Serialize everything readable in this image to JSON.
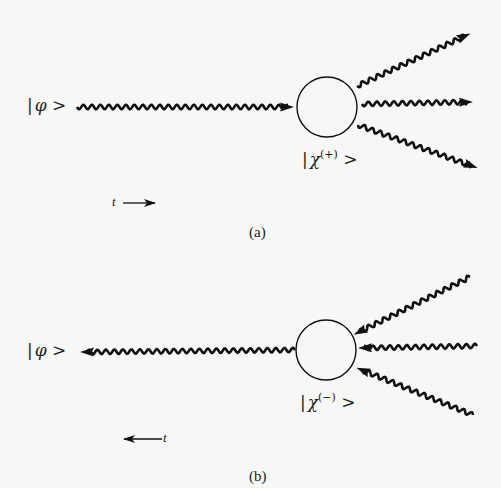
{
  "figure": {
    "panel_a": {
      "caption": "(a)",
      "initial_state": {
        "bar": "|",
        "symbol": "φ",
        "close": ">"
      },
      "scattered_state": {
        "bar": "|",
        "symbol": "χ",
        "sup": "(+)",
        "close": ">"
      },
      "time_arrow": {
        "label": "t",
        "direction": "right"
      }
    },
    "panel_b": {
      "caption": "(b)",
      "initial_state": {
        "bar": "|",
        "symbol": "φ",
        "close": ">"
      },
      "scattered_state": {
        "bar": "|",
        "symbol": "χ",
        "sup": "(−)",
        "close": ">"
      },
      "time_arrow": {
        "label": "t",
        "direction": "left"
      }
    },
    "colors": {
      "ink": "#111111",
      "background": "#f7f7f5"
    }
  }
}
